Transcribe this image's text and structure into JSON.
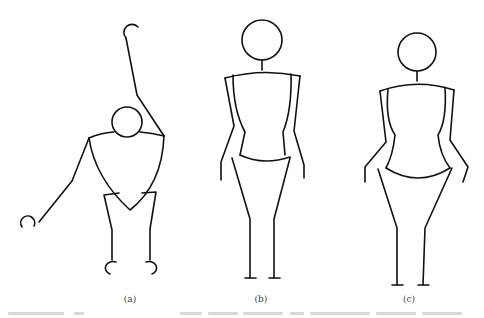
{
  "figure": {
    "panels": [
      {
        "label": "(a)",
        "description": "stick figure bending sideways, one arm raised, one arm lowered, shield-shaped torso"
      },
      {
        "label": "(b)",
        "description": "standing figure with straight body outline, arms at sides"
      },
      {
        "label": "(c)",
        "description": "standing figure with curved hourglass body outline, arms bent outward"
      }
    ],
    "caption": "",
    "colors": {
      "stroke": "#111111",
      "background": "#ffffff"
    }
  }
}
